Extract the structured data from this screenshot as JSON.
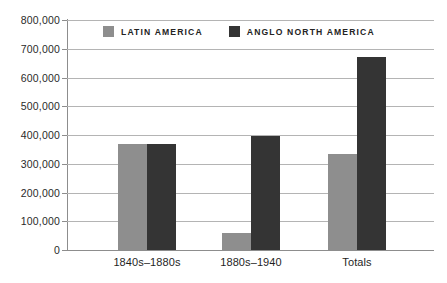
{
  "chart_data": {
    "type": "bar",
    "title": "",
    "subtitle": "",
    "xlabel": "",
    "ylabel": "",
    "categories": [
      "1840s–1880s",
      "1880s–1940",
      "Totals"
    ],
    "series": [
      {
        "name": "LATIN AMERICA",
        "color": "#8e8e8e",
        "values": [
          370000,
          60000,
          335000
        ]
      },
      {
        "name": "ANGLO NORTH AMERICA",
        "color": "#343434",
        "values": [
          370000,
          398000,
          670000
        ]
      }
    ],
    "ylim": [
      0,
      800000
    ],
    "ytick_labels": [
      "800,000",
      "700,000",
      "600,000",
      "500,000",
      "400,000",
      "300,000",
      "200,000",
      "100,000",
      "0"
    ],
    "ytick_values": [
      800000,
      700000,
      600000,
      500000,
      400000,
      300000,
      200000,
      100000,
      0
    ],
    "grid": true,
    "grid_axis": "y",
    "legend_position": "top-center",
    "legend": [
      {
        "label": "LATIN AMERICA",
        "swatch": "#8e8e8e"
      },
      {
        "label": "ANGLO NORTH AMERICA",
        "swatch": "#343434"
      }
    ],
    "annotations": []
  },
  "axis": {
    "y": {
      "labels": [
        {
          "text": "800,000"
        },
        {
          "text": "700,000"
        },
        {
          "text": "600,000"
        },
        {
          "text": "500,000"
        },
        {
          "text": "400,000"
        },
        {
          "text": "300,000"
        },
        {
          "text": "200,000"
        },
        {
          "text": "100,000"
        },
        {
          "text": "0"
        }
      ]
    },
    "x": {
      "labels": [
        {
          "text": "1840s–1880s"
        },
        {
          "text": "1880s–1940"
        },
        {
          "text": "Totals"
        }
      ]
    }
  },
  "legend": {
    "items": [
      {
        "label": "LATIN AMERICA"
      },
      {
        "label": "ANGLO NORTH AMERICA"
      }
    ]
  },
  "colors": {
    "latin_america": "#8e8e8e",
    "anglo_north_america": "#343434",
    "gridline": "#b4b4b4",
    "axis": "#8d8d8d",
    "background": "#ffffff",
    "text": "#1f1f1f"
  }
}
